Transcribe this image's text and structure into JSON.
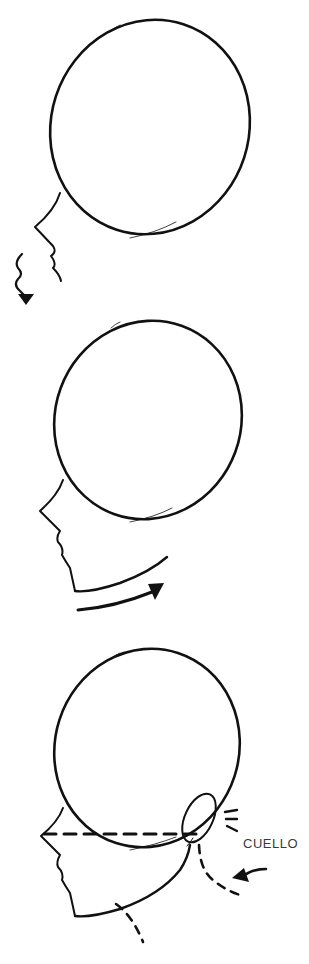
{
  "figure": {
    "panels": [
      {
        "step": 1,
        "description": "head circle with face profile line, wavy arrow pointing down"
      },
      {
        "step": 2,
        "description": "head circle with face profile and jaw, curved arrow pointing right"
      },
      {
        "step": 3,
        "description": "head circle with ear, dashed eye line, dashed neck lines, arrow pointing to neck"
      }
    ],
    "label": "CUELLO",
    "colors": {
      "ink": "#111111",
      "label": "#3a3a3a",
      "background": "#ffffff"
    }
  }
}
